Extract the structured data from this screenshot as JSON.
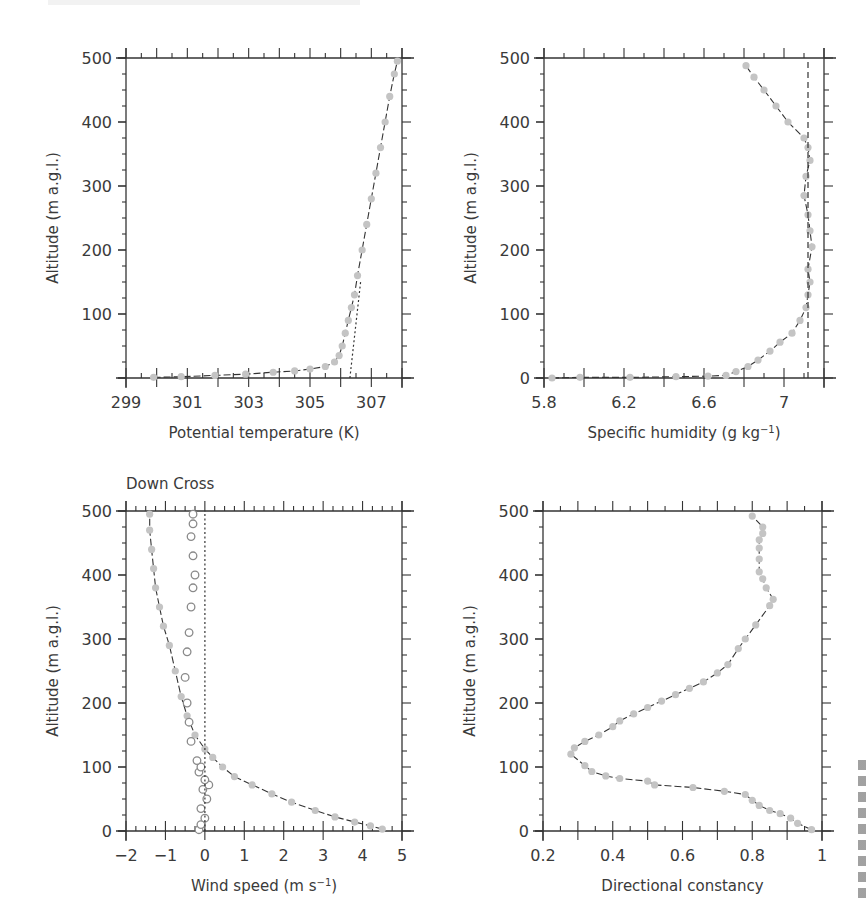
{
  "figure": {
    "panels": [
      {
        "id": "potential-temperature",
        "title": "",
        "xlabel": "Potential temperature (K)",
        "ylabel": "Altitude (m a.g.l.)",
        "xticks": [
          "299",
          "301",
          "303",
          "305",
          "307"
        ],
        "yticks": [
          "100",
          "200",
          "300",
          "400",
          "500"
        ]
      },
      {
        "id": "specific-humidity",
        "title": "",
        "xlabel": "Specific humidity (g kg",
        "xlabel_sup": "−1",
        "xlabel_end": ")",
        "ylabel": "Altitude (m a.g.l.)",
        "xticks": [
          "5.8",
          "6.2",
          "6.6",
          "7"
        ],
        "yticks": [
          "0",
          "100",
          "200",
          "300",
          "400",
          "500"
        ]
      },
      {
        "id": "wind-speed",
        "title": "Down Cross",
        "xlabel": "Wind speed (m s",
        "xlabel_sup": "−1",
        "xlabel_end": ")",
        "ylabel": "Altitude (m a.g.l.)",
        "xticks": [
          "−2",
          "−1",
          "0",
          "1",
          "2",
          "3",
          "4",
          "5"
        ],
        "yticks": [
          "0",
          "100",
          "200",
          "300",
          "400",
          "500"
        ]
      },
      {
        "id": "directional-constancy",
        "title": "",
        "xlabel": "Directional constancy",
        "ylabel": "Altitude (m a.g.l.)",
        "xticks": [
          "0.2",
          "0.4",
          "0.6",
          "0.8",
          "1"
        ],
        "yticks": [
          "0",
          "100",
          "200",
          "300",
          "400",
          "500"
        ]
      }
    ],
    "colors": {
      "marker_fill": "#c4c4c4",
      "line": "#333333",
      "open_marker": "#8a8a8a",
      "axis": "#333333",
      "text": "#3a3a3a"
    }
  },
  "chart_data": [
    {
      "type": "line",
      "title": "",
      "xlabel": "Potential temperature (K)",
      "ylabel": "Altitude (m a.g.l.)",
      "xlim": [
        299,
        308
      ],
      "ylim": [
        0,
        500
      ],
      "grid": false,
      "series": [
        {
          "name": "Potential temperature profile",
          "marker": "filled-circle",
          "x": [
            299.9,
            300.8,
            301.9,
            302.9,
            303.8,
            304.5,
            305.0,
            305.5,
            305.8,
            305.95,
            306.05,
            306.15,
            306.25,
            306.35,
            306.45,
            306.55,
            306.7,
            306.85,
            307.0,
            307.15,
            307.3,
            307.45,
            307.6,
            307.75,
            307.85
          ],
          "y": [
            1,
            2,
            4,
            6,
            9,
            11,
            14,
            18,
            25,
            35,
            50,
            70,
            90,
            110,
            130,
            160,
            200,
            240,
            280,
            320,
            360,
            400,
            440,
            475,
            495
          ]
        },
        {
          "name": "Reference gradient",
          "style": "dotted",
          "x": [
            306.3,
            306.65
          ],
          "y": [
            0,
            150
          ]
        }
      ]
    },
    {
      "type": "line",
      "title": "",
      "xlabel": "Specific humidity (g kg^-1)",
      "ylabel": "Altitude (m a.g.l.)",
      "xlim": [
        5.8,
        7.2
      ],
      "ylim": [
        0,
        500
      ],
      "grid": false,
      "series": [
        {
          "name": "Specific humidity profile",
          "marker": "filled-circle",
          "x": [
            5.84,
            5.98,
            6.23,
            6.46,
            6.62,
            6.71,
            6.76,
            6.82,
            6.87,
            6.93,
            6.98,
            7.04,
            7.08,
            7.11,
            7.12,
            7.13,
            7.12,
            7.14,
            7.13,
            7.12,
            7.1,
            7.11,
            7.13,
            7.12,
            7.1,
            7.02,
            6.96,
            6.9,
            6.85,
            6.81
          ],
          "y": [
            0,
            1,
            1,
            2,
            3,
            4,
            10,
            18,
            28,
            42,
            56,
            70,
            90,
            110,
            130,
            150,
            170,
            205,
            230,
            255,
            285,
            315,
            340,
            360,
            375,
            400,
            425,
            450,
            470,
            488
          ]
        },
        {
          "name": "Reference value",
          "style": "dashed",
          "x": [
            7.12,
            7.12
          ],
          "y": [
            0,
            500
          ]
        }
      ]
    },
    {
      "type": "line",
      "title": "Down Cross",
      "xlabel": "Wind speed (m s^-1)",
      "ylabel": "Altitude (m a.g.l.)",
      "xlim": [
        -2,
        5
      ],
      "ylim": [
        0,
        500
      ],
      "grid": false,
      "series": [
        {
          "name": "Down",
          "marker": "filled-circle",
          "x": [
            4.5,
            4.2,
            3.8,
            3.3,
            2.8,
            2.2,
            1.7,
            1.2,
            0.75,
            0.45,
            0.2,
            0.0,
            -0.25,
            -0.45,
            -0.6,
            -0.75,
            -0.9,
            -1.05,
            -1.15,
            -1.25,
            -1.3,
            -1.35,
            -1.4,
            -1.4
          ],
          "y": [
            3,
            8,
            14,
            22,
            32,
            45,
            58,
            72,
            85,
            100,
            115,
            128,
            150,
            180,
            210,
            250,
            290,
            320,
            350,
            380,
            410,
            440,
            470,
            495
          ]
        },
        {
          "name": "Cross",
          "marker": "open-circle",
          "x": [
            -0.15,
            -0.1,
            0.0,
            -0.1,
            0.05,
            -0.05,
            0.1,
            0.0,
            -0.15,
            -0.1,
            -0.2,
            -0.35,
            -0.4,
            -0.45,
            -0.5,
            -0.45,
            -0.4,
            -0.35,
            -0.3,
            -0.25,
            -0.3,
            -0.35,
            -0.3,
            -0.3
          ],
          "y": [
            2,
            10,
            20,
            35,
            50,
            65,
            72,
            80,
            92,
            100,
            110,
            140,
            170,
            200,
            240,
            280,
            310,
            350,
            380,
            400,
            430,
            460,
            480,
            495
          ]
        },
        {
          "name": "Zero reference",
          "style": "dotted",
          "x": [
            0,
            0
          ],
          "y": [
            0,
            500
          ]
        }
      ]
    },
    {
      "type": "line",
      "title": "",
      "xlabel": "Directional constancy",
      "ylabel": "Altitude (m a.g.l.)",
      "xlim": [
        0.2,
        1.0
      ],
      "ylim": [
        0,
        500
      ],
      "grid": false,
      "series": [
        {
          "name": "Directional constancy profile",
          "marker": "filled-circle",
          "x": [
            0.97,
            0.93,
            0.91,
            0.88,
            0.85,
            0.82,
            0.8,
            0.78,
            0.72,
            0.63,
            0.52,
            0.5,
            0.42,
            0.38,
            0.34,
            0.32,
            0.28,
            0.29,
            0.32,
            0.36,
            0.4,
            0.42,
            0.46,
            0.5,
            0.54,
            0.58,
            0.62,
            0.66,
            0.7,
            0.73,
            0.76,
            0.78,
            0.81,
            0.85,
            0.86,
            0.84,
            0.83,
            0.82,
            0.82,
            0.82,
            0.82,
            0.83,
            0.83,
            0.8
          ],
          "y": [
            2,
            12,
            20,
            27,
            32,
            40,
            48,
            57,
            62,
            68,
            72,
            78,
            82,
            86,
            93,
            102,
            120,
            130,
            140,
            150,
            163,
            172,
            183,
            193,
            203,
            213,
            223,
            233,
            247,
            260,
            285,
            300,
            322,
            352,
            362,
            380,
            394,
            405,
            425,
            442,
            455,
            465,
            475,
            492
          ]
        }
      ]
    }
  ]
}
